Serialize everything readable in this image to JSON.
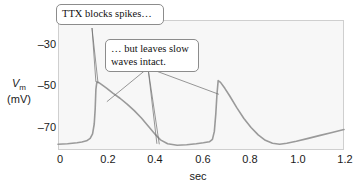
{
  "figure": {
    "background_color": "#ffffff",
    "plot_fill": "#f7f7f7",
    "plot_border_color": "#cfcfcf",
    "trace_color": "#9a9a9a",
    "leader_color": "#6b6b6b"
  },
  "axes": {
    "y": {
      "label_line1": "V",
      "label_sub": "m",
      "label_line2": "(mV)",
      "ticks": [
        "–30",
        "–50",
        "–70"
      ],
      "tick_values": [
        -30,
        -50,
        -70
      ],
      "range": [
        -76.5,
        -24
      ]
    },
    "x": {
      "label": "sec",
      "ticks": [
        "0",
        "0.2",
        "0.4",
        "0.6",
        "0.8",
        "1.0",
        "1.2"
      ],
      "tick_values": [
        0,
        0.2,
        0.4,
        0.6,
        0.8,
        1.0,
        1.2
      ],
      "range": [
        0,
        1.2
      ]
    }
  },
  "callouts": [
    {
      "id": "ttx",
      "text": "TTX blocks spikes…"
    },
    {
      "id": "slow",
      "text": "… but leaves slow\nwaves intact."
    }
  ],
  "chart_data": {
    "type": "line",
    "title": "",
    "xlabel": "sec",
    "ylabel": "Vm (mV)",
    "xlim": [
      0,
      1.2
    ],
    "ylim": [
      -76.5,
      -24
    ],
    "grid": false,
    "legend": null,
    "annotations": [
      {
        "text": "TTX blocks spikes…",
        "points_to": [
          [
            0.159,
            -49.0
          ],
          [
            0.168,
            -49.5
          ]
        ]
      },
      {
        "text": "… but leaves slow waves intact.",
        "points_to": [
          [
            0.205,
            -57.0
          ],
          [
            0.415,
            -74.0
          ],
          [
            0.425,
            -74.2
          ],
          [
            0.675,
            -54.0
          ]
        ]
      }
    ],
    "series": [
      {
        "name": "Vm",
        "x": [
          0.0,
          0.02,
          0.04,
          0.06,
          0.08,
          0.1,
          0.12,
          0.135,
          0.145,
          0.152,
          0.156,
          0.159,
          0.163,
          0.17,
          0.185,
          0.205,
          0.23,
          0.26,
          0.29,
          0.32,
          0.35,
          0.38,
          0.41,
          0.43,
          0.46,
          0.5,
          0.54,
          0.58,
          0.61,
          0.635,
          0.648,
          0.656,
          0.662,
          0.667,
          0.672,
          0.682,
          0.7,
          0.72,
          0.75,
          0.78,
          0.81,
          0.84,
          0.87,
          0.9,
          0.93,
          0.96,
          1.0,
          1.05,
          1.1,
          1.15,
          1.2
        ],
        "y": [
          -74.2,
          -74.1,
          -74.0,
          -73.8,
          -73.6,
          -73.3,
          -72.8,
          -71.8,
          -70.0,
          -66.0,
          -60.0,
          -52.0,
          -49.0,
          -49.2,
          -50.2,
          -51.6,
          -53.5,
          -55.6,
          -58.0,
          -60.6,
          -63.6,
          -67.0,
          -70.4,
          -72.4,
          -74.0,
          -74.6,
          -74.4,
          -74.0,
          -73.6,
          -73.2,
          -72.2,
          -69.0,
          -62.0,
          -54.0,
          -48.5,
          -49.2,
          -51.6,
          -54.6,
          -59.4,
          -63.8,
          -67.4,
          -70.4,
          -72.6,
          -73.8,
          -74.2,
          -73.8,
          -73.0,
          -71.8,
          -70.6,
          -69.4,
          -68.2
        ]
      }
    ]
  }
}
